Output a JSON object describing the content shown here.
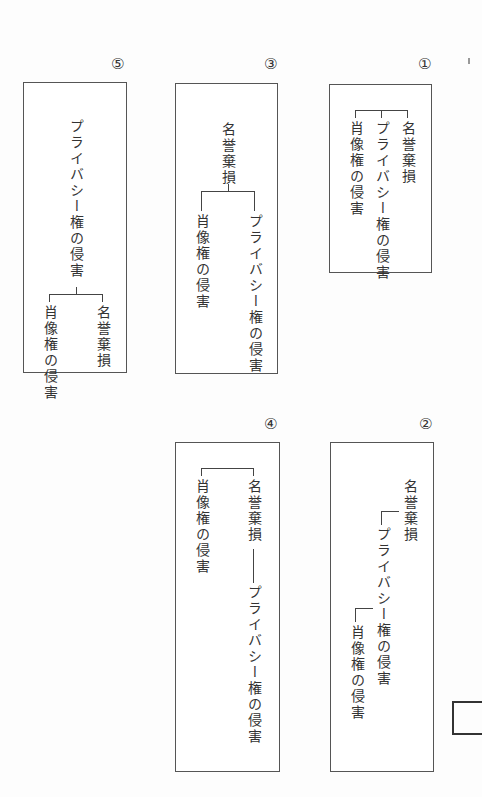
{
  "figure": {
    "terms": {
      "defamation": "名誉棄損",
      "privacy": "プライバシー権の侵害",
      "portrait": "肖像権の侵害"
    },
    "options": [
      {
        "number": "①",
        "structure": "名誉棄損・プライバシー権の侵害・肖像権の侵害 が同列に並ぶ"
      },
      {
        "number": "②",
        "structure": "名誉棄損 → プライバシー権の侵害 → 肖像権の侵害（段階的）"
      },
      {
        "number": "③",
        "structure": "名誉棄損 の下に プライバシー権の侵害 と 肖像権の侵害"
      },
      {
        "number": "④",
        "structure": "名誉棄損 と 肖像権の侵害 が並び、名誉棄損 の下に プライバシー権の侵害"
      },
      {
        "number": "⑤",
        "structure": "プライバシー権の侵害 の下に 名誉棄損 と 肖像権の侵害"
      }
    ]
  },
  "labels": {
    "n1": "①",
    "n2": "②",
    "n3": "③",
    "n4": "④",
    "n5": "⑤",
    "b1": {
      "a": "名誉棄損",
      "b": "プライバシー権の侵害",
      "c": "肖像権の侵害"
    },
    "b2": {
      "a": "名誉棄損",
      "b": "プライバシー権の侵害",
      "c": "肖像権の侵害"
    },
    "b3": {
      "a": "名誉棄損",
      "b": "プライバシー権の侵害",
      "c": "肖像権の侵害"
    },
    "b4": {
      "a": "名誉棄損",
      "b": "プライバシー権の侵害",
      "c": "肖像権の侵害"
    },
    "b5": {
      "a": "プライバシー権の侵害",
      "b": "名誉棄損",
      "c": "肖像権の侵害"
    }
  }
}
